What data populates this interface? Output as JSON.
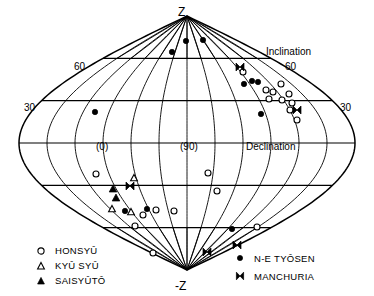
{
  "figure": {
    "title": "",
    "projection": "sinusoidal-equal-area",
    "poles": {
      "top_label": "Z",
      "bottom_label": "-Z"
    },
    "axis_labels": {
      "inclination": "Inclination",
      "declination": "Declination"
    },
    "inclination_ticks": {
      "left_60": "60",
      "left_30": "30",
      "right_60": "60",
      "right_30": "30"
    },
    "declination_ticks": {
      "d0": "(0)",
      "d90": "(90)",
      "d180": "(180)"
    }
  },
  "legend": {
    "left": [
      {
        "label": "HONSYÛ",
        "marker": "open-circle"
      },
      {
        "label": "KYÛ SYÛ",
        "marker": "open-triangle"
      },
      {
        "label": "SAISYÛTÔ",
        "marker": "filled-triangle"
      }
    ],
    "right": [
      {
        "label": "N-E TYÔSEN",
        "marker": "filled-circle"
      },
      {
        "label": "MANCHURIA",
        "marker": "bowtie"
      }
    ]
  },
  "colors": {
    "ink": "#000000",
    "paper": "#ffffff"
  },
  "chart_data": {
    "type": "scatter",
    "title": "",
    "xlabel": "Declination",
    "ylabel": "Inclination",
    "projection": "sinusoidal",
    "xlim": [
      -90,
      270
    ],
    "ylim": [
      -90,
      90
    ],
    "grid": true,
    "legend_position": "bottom-left and bottom-right",
    "xticks": [
      0,
      90,
      180
    ],
    "xticklabels": [
      "(0)",
      "(90)",
      "(180)"
    ],
    "yticks": [
      -60,
      -30,
      0,
      30,
      60
    ],
    "yticklabels": [
      "60",
      "30",
      "",
      "30",
      "60"
    ],
    "series": [
      {
        "name": "HONSYÛ",
        "marker": "open-circle",
        "points": [
          {
            "px": 243,
            "py": 72
          },
          {
            "px": 281,
            "py": 84
          },
          {
            "px": 266,
            "py": 90
          },
          {
            "px": 273,
            "py": 92
          },
          {
            "px": 289,
            "py": 94
          },
          {
            "px": 269,
            "py": 99
          },
          {
            "px": 282,
            "py": 100
          },
          {
            "px": 292,
            "py": 103
          },
          {
            "px": 290,
            "py": 110
          },
          {
            "px": 297,
            "py": 120
          },
          {
            "px": 96,
            "py": 174
          },
          {
            "px": 208,
            "py": 173
          },
          {
            "px": 217,
            "py": 191
          },
          {
            "px": 156,
            "py": 210
          },
          {
            "px": 174,
            "py": 211
          },
          {
            "px": 143,
            "py": 215
          },
          {
            "px": 135,
            "py": 226
          },
          {
            "px": 257,
            "py": 227
          },
          {
            "px": 153,
            "py": 253
          }
        ]
      },
      {
        "name": "KYÛ SYÛ",
        "marker": "open-triangle",
        "points": [
          {
            "px": 134,
            "py": 178
          },
          {
            "px": 112,
            "py": 209
          },
          {
            "px": 131,
            "py": 212
          }
        ]
      },
      {
        "name": "SAISYÛTÔ",
        "marker": "filled-triangle",
        "points": [
          {
            "px": 113,
            "py": 189
          },
          {
            "px": 116,
            "py": 198
          }
        ]
      },
      {
        "name": "N-E TYÔSEN",
        "marker": "filled-circle",
        "points": [
          {
            "px": 186,
            "py": 41
          },
          {
            "px": 203,
            "py": 40
          },
          {
            "px": 172,
            "py": 52
          },
          {
            "px": 252,
            "py": 81
          },
          {
            "px": 244,
            "py": 84
          },
          {
            "px": 258,
            "py": 82
          },
          {
            "px": 95,
            "py": 112
          },
          {
            "px": 261,
            "py": 114
          },
          {
            "px": 125,
            "py": 211
          },
          {
            "px": 147,
            "py": 209
          },
          {
            "px": 232,
            "py": 229
          }
        ]
      },
      {
        "name": "MANCHURIA",
        "marker": "bowtie",
        "points": [
          {
            "px": 240,
            "py": 67
          },
          {
            "px": 297,
            "py": 110
          },
          {
            "px": 207,
            "py": 252
          },
          {
            "px": 237,
            "py": 245
          },
          {
            "px": 130,
            "py": 186
          }
        ]
      }
    ]
  }
}
